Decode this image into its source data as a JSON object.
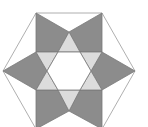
{
  "diagram": {
    "type": "geometric-figure",
    "colors": {
      "background": "#ffffff",
      "square_fill": "#8c8c8c",
      "triangle_fill": "#dcdcdc",
      "center_fill": "#ffffff",
      "outline": "#7a7a7a",
      "hexagon_stroke": "#9a9a9a"
    },
    "hexagon": {
      "points": "36,13 102,13 135,71 102,129 36,129 3,71"
    },
    "dark_quads": [
      {
        "name": "quad-top-left",
        "points": "36,13 69,32 58,52 36,52"
      },
      {
        "name": "quad-top-right",
        "points": "102,13 102,52 80,52 69,32"
      },
      {
        "name": "quad-left",
        "points": "3,71 36,52 47,71 36,90"
      },
      {
        "name": "quad-right",
        "points": "135,71 102,90 91,71 102,52"
      },
      {
        "name": "quad-bottom-left",
        "points": "36,129 36,90 58,90 69,111"
      },
      {
        "name": "quad-bottom-right",
        "points": "102,129 69,111 80,90 102,90"
      }
    ],
    "light_triangles": [
      {
        "name": "tri-top",
        "points": "69,32 80,52 58,52"
      },
      {
        "name": "tri-upper-right",
        "points": "102,52 91,71 80,52"
      },
      {
        "name": "tri-lower-right",
        "points": "102,90 80,90 91,71"
      },
      {
        "name": "tri-bottom",
        "points": "69,111 58,90 80,90"
      },
      {
        "name": "tri-lower-left",
        "points": "36,90 47,71 58,90"
      },
      {
        "name": "tri-upper-left",
        "points": "36,52 58,52 47,71"
      }
    ],
    "center_hexagon": {
      "points": "58,52 80,52 91,71 80,90 58,90 47,71"
    }
  }
}
